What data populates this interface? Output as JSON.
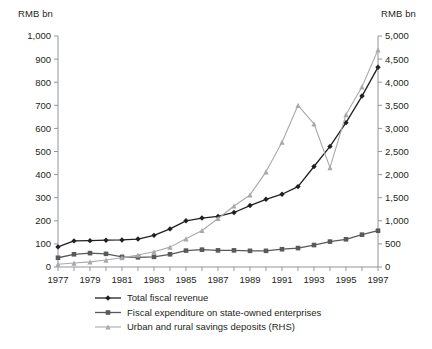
{
  "axis_titles": {
    "left": "RMB bn",
    "right": "RMB bn"
  },
  "legend": {
    "items": [
      {
        "label": "Total fiscal revenue",
        "marker": "diamond",
        "color": "#231f20"
      },
      {
        "label": "Fiscal expenditure on state-owned enterprises",
        "marker": "square",
        "color": "#58595b"
      },
      {
        "label": "Urban and rural savings deposits (RHS)",
        "marker": "triangle",
        "color": "#a7a9ac"
      }
    ]
  },
  "chart_data": {
    "type": "line",
    "title": "",
    "xlabel": "",
    "ylabel": "RMB bn",
    "y2label": "RMB bn",
    "grid": false,
    "legend_position": "bottom",
    "x": [
      1977,
      1978,
      1979,
      1980,
      1981,
      1982,
      1983,
      1984,
      1985,
      1986,
      1987,
      1988,
      1989,
      1990,
      1991,
      1992,
      1993,
      1994,
      1995,
      1996,
      1997
    ],
    "xtick_labels": [
      "1977",
      "1979",
      "1981",
      "1983",
      "1985",
      "1987",
      "1989",
      "1991",
      "1993",
      "1995",
      "1997"
    ],
    "ylim": [
      0,
      1000
    ],
    "ytick_labels": [
      "0",
      "100",
      "200",
      "300",
      "400",
      "500",
      "600",
      "700",
      "800",
      "900",
      "1,000"
    ],
    "ytick_values": [
      0,
      100,
      200,
      300,
      400,
      500,
      600,
      700,
      800,
      900,
      1000
    ],
    "y2lim": [
      0,
      5000
    ],
    "y2tick_labels": [
      "0",
      "500",
      "1,000",
      "1,500",
      "2,000",
      "2,500",
      "3,000",
      "3,500",
      "4,000",
      "4,500",
      "5,000"
    ],
    "y2tick_values": [
      0,
      500,
      1000,
      1500,
      2000,
      2500,
      3000,
      3500,
      4000,
      4500,
      5000
    ],
    "series": [
      {
        "name": "Total fiscal revenue",
        "axis": "left",
        "color": "#231f20",
        "marker": "diamond",
        "values": [
          87,
          113,
          114,
          116,
          117,
          121,
          137,
          165,
          200,
          212,
          219,
          236,
          266,
          293,
          315,
          348,
          435,
          522,
          625,
          740,
          865
        ]
      },
      {
        "name": "Fiscal expenditure on state-owned enterprises",
        "axis": "left",
        "color": "#58595b",
        "marker": "square",
        "values": [
          40,
          55,
          60,
          57,
          44,
          42,
          44,
          55,
          71,
          75,
          72,
          72,
          70,
          70,
          77,
          82,
          95,
          110,
          120,
          140,
          157
        ]
      },
      {
        "name": "Urban and rural savings deposits (RHS)",
        "axis": "right",
        "color": "#a7a9ac",
        "marker": "triangle",
        "values": [
          60,
          85,
          110,
          150,
          200,
          260,
          330,
          430,
          610,
          790,
          1050,
          1320,
          1560,
          2060,
          2700,
          3500,
          3100,
          2150,
          3300,
          3900,
          4700
        ]
      }
    ]
  }
}
